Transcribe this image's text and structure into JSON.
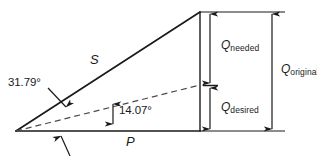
{
  "diagram": {
    "type": "power-triangle-vector-diagram",
    "stroke_color": "#1a1a1a",
    "background_color": "#ffffff",
    "labels": {
      "angle_original": "31.79°",
      "angle_desired": "14.07°",
      "vector_s": "S",
      "vector_p": "P",
      "q_needed_main": "Q",
      "q_needed_sub": "needed",
      "q_desired_main": "Q",
      "q_desired_sub": "desired",
      "q_original_main": "Q",
      "q_original_sub": "original"
    },
    "geometry": {
      "apex_x": 16,
      "apex_y": 131,
      "right_x": 200,
      "top_y": 12,
      "dashed_end_y": 85,
      "dim_inner_x": 210,
      "dim_outer_x": 272,
      "extension_right_x": 285
    }
  }
}
